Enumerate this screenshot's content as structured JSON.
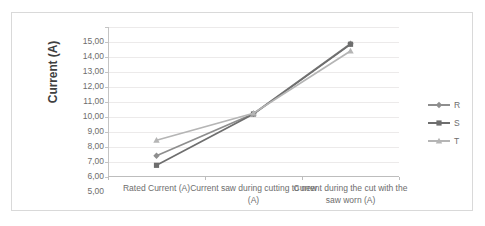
{
  "chart_data": {
    "type": "line",
    "title": "",
    "xlabel": "",
    "ylabel": "Current (A)",
    "categories": [
      "Rated Current (A)",
      "Current saw during cutting to new (A)",
      "Current during the cut with the saw worn (A)"
    ],
    "series": [
      {
        "name": "R",
        "values": [
          6.42,
          9.22,
          13.88
        ],
        "color": "#8e8e8e",
        "marker": "diamond"
      },
      {
        "name": "S",
        "values": [
          5.78,
          9.2,
          13.85
        ],
        "color": "#6e6e6e",
        "marker": "square"
      },
      {
        "name": "T",
        "values": [
          7.45,
          9.25,
          13.4
        ],
        "color": "#b5b5b5",
        "marker": "triangle"
      }
    ],
    "ylim": [
      5.0,
      15.0
    ],
    "ytick_step": 1.0,
    "ytick_labels": [
      "15,00",
      "14,00",
      "13,00",
      "12,00",
      "11,00",
      "10,00",
      "9,00",
      "8,00",
      "7,00",
      "6,00",
      "5,00"
    ],
    "grid": true,
    "legend_position": "right",
    "decimal_separator": ",",
    "plot_background": "#ffffff",
    "gridline_color": "#eceaea",
    "axis_color": "#c4c4c4",
    "border_color": "#d9d9d9",
    "text_color": "#6d6d6d",
    "title_color": "#3f3f3f"
  }
}
